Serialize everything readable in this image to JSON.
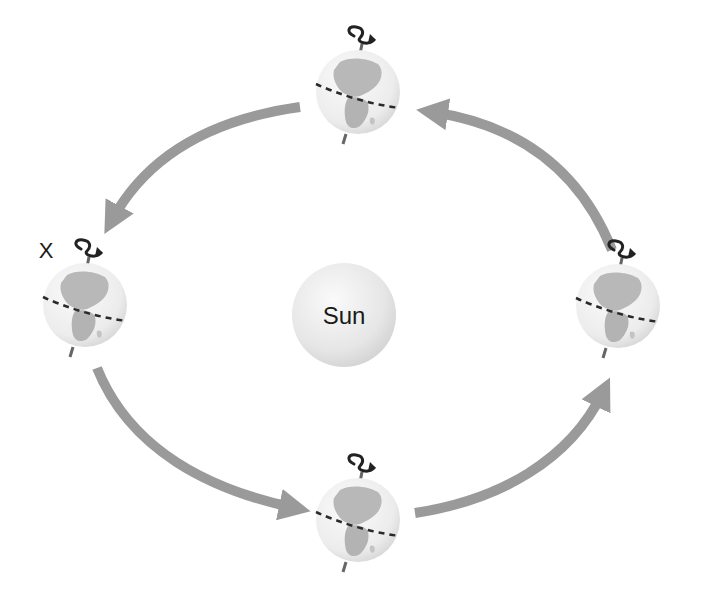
{
  "sun": {
    "label": "Sun"
  },
  "marker": {
    "label": "X",
    "position": "left"
  },
  "earths": [
    {
      "id": "top",
      "position": "top"
    },
    {
      "id": "left",
      "position": "left",
      "marked": true
    },
    {
      "id": "right",
      "position": "right"
    },
    {
      "id": "bottom",
      "position": "bottom"
    }
  ],
  "orbit": {
    "direction": "counter-clockwise",
    "arrow_count": 4
  },
  "colors": {
    "arrow": "#9a9a9a",
    "globe_ocean": "#f1f1f1",
    "globe_land": "#b5b5b5",
    "equator": "#2a2a2a",
    "sun_fill": "#e8e8e8",
    "axis": "#555555"
  }
}
